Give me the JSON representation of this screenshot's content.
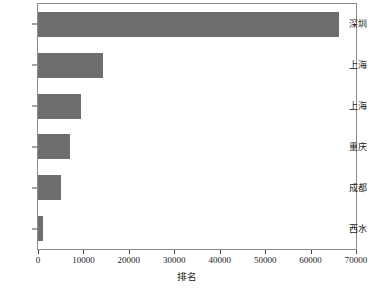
{
  "chart_data": {
    "type": "bar",
    "orientation": "horizontal",
    "title": "",
    "xlabel": "排名",
    "ylabel": "",
    "categories": [
      "深圳",
      "上海",
      "上海",
      "重庆",
      "成都",
      "西水"
    ],
    "values": [
      66250,
      14300,
      9500,
      7000,
      5100,
      1150
    ],
    "xlim": [
      0,
      70000
    ],
    "xticks": [
      0,
      10000,
      20000,
      30000,
      40000,
      50000,
      60000,
      70000
    ],
    "xticklabels": [
      "0",
      "10000",
      "20000",
      "30000",
      "40000",
      "50000",
      "60000",
      "70000"
    ],
    "grid": false,
    "legend": false,
    "bar_color": "#6e6e6e",
    "frame_color": "#8a8a8a",
    "background": "#ffffff"
  }
}
